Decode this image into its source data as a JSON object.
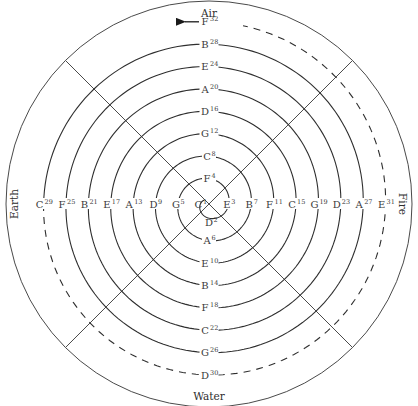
{
  "diagram": {
    "elements": {
      "top": "Air",
      "left": "Earth",
      "right": "Fire",
      "bottom": "Water"
    },
    "direction_order": [
      "left",
      "bottom",
      "right",
      "top"
    ],
    "notes": [
      {
        "n": 1,
        "name": "C",
        "side": "left"
      },
      {
        "n": 2,
        "name": "D",
        "side": "bottom"
      },
      {
        "n": 3,
        "name": "E",
        "side": "right"
      },
      {
        "n": 4,
        "name": "F",
        "side": "top"
      },
      {
        "n": 5,
        "name": "G",
        "side": "left"
      },
      {
        "n": 6,
        "name": "A",
        "side": "bottom"
      },
      {
        "n": 7,
        "name": "B",
        "side": "right"
      },
      {
        "n": 8,
        "name": "C",
        "side": "top"
      },
      {
        "n": 9,
        "name": "D",
        "side": "left"
      },
      {
        "n": 10,
        "name": "E",
        "side": "bottom"
      },
      {
        "n": 11,
        "name": "F",
        "side": "right"
      },
      {
        "n": 12,
        "name": "G",
        "side": "top"
      },
      {
        "n": 13,
        "name": "A",
        "side": "left"
      },
      {
        "n": 14,
        "name": "B",
        "side": "bottom"
      },
      {
        "n": 15,
        "name": "C",
        "side": "right"
      },
      {
        "n": 16,
        "name": "D",
        "side": "top"
      },
      {
        "n": 17,
        "name": "E",
        "side": "left"
      },
      {
        "n": 18,
        "name": "F",
        "side": "bottom"
      },
      {
        "n": 19,
        "name": "G",
        "side": "right"
      },
      {
        "n": 20,
        "name": "A",
        "side": "top"
      },
      {
        "n": 21,
        "name": "B",
        "side": "left"
      },
      {
        "n": 22,
        "name": "C",
        "side": "bottom"
      },
      {
        "n": 23,
        "name": "D",
        "side": "right"
      },
      {
        "n": 24,
        "name": "E",
        "side": "top"
      },
      {
        "n": 25,
        "name": "F",
        "side": "left"
      },
      {
        "n": 26,
        "name": "G",
        "side": "bottom"
      },
      {
        "n": 27,
        "name": "A",
        "side": "right"
      },
      {
        "n": 28,
        "name": "B",
        "side": "top"
      },
      {
        "n": 29,
        "name": "C",
        "side": "left"
      },
      {
        "n": 30,
        "name": "D",
        "side": "bottom"
      },
      {
        "n": 31,
        "name": "E",
        "side": "right"
      },
      {
        "n": 32,
        "name": "F",
        "side": "top"
      }
    ],
    "solid_until_note": 29,
    "dashed_from_note": 29,
    "end_arrow": "arrow-left"
  }
}
